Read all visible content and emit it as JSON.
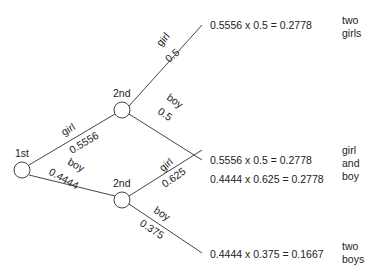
{
  "diagram": {
    "type": "probability-tree",
    "root": {
      "label": "1st"
    },
    "first_branches": [
      {
        "label": "girl",
        "prob": "0.5556"
      },
      {
        "label": "boy",
        "prob": "0.4444"
      }
    ],
    "second_nodes": [
      {
        "label": "2nd",
        "branches": [
          {
            "label": "girl",
            "prob": "0.5"
          },
          {
            "label": "boy",
            "prob": "0.5"
          }
        ]
      },
      {
        "label": "2nd",
        "branches": [
          {
            "label": "girl",
            "prob": "0.625"
          },
          {
            "label": "boy",
            "prob": "0.375"
          }
        ]
      }
    ],
    "results": [
      "0.5556 x 0.5 = 0.2778",
      "0.5556 x 0.5 = 0.2778",
      "0.4444 x 0.625 = 0.2778",
      "0.4444 x 0.375 = 0.1667"
    ],
    "outcomes": [
      {
        "lines": [
          "two",
          "girls"
        ]
      },
      {
        "lines": [
          "girl",
          "and",
          "boy"
        ]
      },
      {
        "lines": [
          "two",
          "boys"
        ]
      }
    ]
  }
}
